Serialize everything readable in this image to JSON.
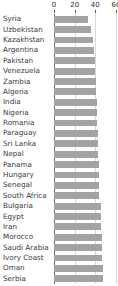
{
  "chart_data": {
    "type": "bar",
    "orientation": "horizontal",
    "title": "",
    "subtitle": "",
    "xlabel": "",
    "ylabel": "",
    "xlim": [
      0,
      60
    ],
    "xticks": [
      0,
      20,
      40,
      60
    ],
    "xtick_labels": [
      "0",
      "20",
      "40",
      "60"
    ],
    "grid": true,
    "legend": false,
    "legend_position": "none",
    "bar_color": "#a3a3a3",
    "axis_color": "#6e6e6e",
    "grid_color": "#d8d8d8",
    "categories": [
      "Syria",
      "Uzbekistan",
      "Kazakhstan",
      "Argentina",
      "Pakistan",
      "Venezuela",
      "Zambia",
      "Algeria",
      "India",
      "Nigeria",
      "Romania",
      "Paraguay",
      "Sri Lanka",
      "Nepal",
      "Panama",
      "Hungary",
      "Senegal",
      "South Africa",
      "Bulgaria",
      "Egypt",
      "Iran",
      "Morocco",
      "Saudi Arabia",
      "Ivory Coast",
      "Oman",
      "Serbia"
    ],
    "values": [
      33,
      36,
      38,
      39,
      40,
      40,
      41,
      41,
      42,
      42,
      42,
      43,
      43,
      43,
      44,
      44,
      44,
      44,
      45,
      45,
      45,
      46,
      46,
      46,
      47,
      47
    ]
  }
}
